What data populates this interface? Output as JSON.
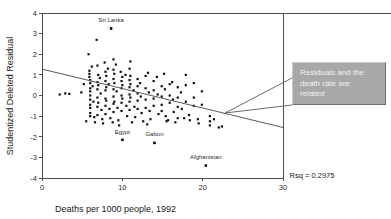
{
  "chart_data": {
    "type": "scatter",
    "title": "",
    "xlabel": "Deaths per 1000 people, 1992",
    "ylabel": "Studentized Deleted Residual",
    "xlim": [
      0,
      30
    ],
    "ylim": [
      -4,
      4
    ],
    "xticks": [
      0,
      10,
      20,
      30
    ],
    "xtick_labels": [
      "0",
      "10",
      "20",
      "30"
    ],
    "yticks": [
      4,
      3,
      2,
      1,
      0,
      -1,
      -2,
      -3,
      -4
    ],
    "ytick_labels": [
      "4",
      "3",
      "2",
      "1",
      "0",
      "-1",
      "-2",
      "-3",
      "-4"
    ],
    "grid": false,
    "legend": null,
    "annotations": [
      {
        "text": "Sri Lanka",
        "x": 8.6,
        "y": 3.55,
        "point_x": 8.6,
        "point_y": 3.25
      },
      {
        "text": "Egypt",
        "x": 10.0,
        "y": -1.85,
        "point_x": 10.0,
        "point_y": -2.15
      },
      {
        "text": "Gabon",
        "x": 14.0,
        "y": -1.95,
        "point_x": 14.0,
        "point_y": -2.3
      },
      {
        "text": "Afghanistan",
        "x": 20.4,
        "y": -3.1,
        "point_x": 20.4,
        "point_y": -3.4
      }
    ],
    "fit_line": {
      "x0": 0.0,
      "y0": 1.28,
      "x1": 30.0,
      "y1": -1.55
    },
    "rsq_label": "Rsq = 0.2975",
    "rsq_value": 0.2975,
    "points": [
      [
        2.2,
        0.05
      ],
      [
        3.4,
        0.08
      ],
      [
        5.8,
        2.0
      ],
      [
        5.9,
        1.2
      ],
      [
        5.9,
        1.05
      ],
      [
        5.9,
        0.9
      ],
      [
        6.0,
        0.75
      ],
      [
        6.0,
        0.6
      ],
      [
        6.0,
        0.35
      ],
      [
        6.0,
        0.2
      ],
      [
        6.0,
        0.0
      ],
      [
        6.0,
        -0.2
      ],
      [
        6.0,
        -0.45
      ],
      [
        6.0,
        -0.6
      ],
      [
        6.0,
        -0.85
      ],
      [
        6.0,
        -1.0
      ],
      [
        6.2,
        1.4
      ],
      [
        6.3,
        0.45
      ],
      [
        6.4,
        -0.3
      ],
      [
        6.5,
        -1.05
      ],
      [
        6.8,
        2.7
      ],
      [
        6.9,
        1.45
      ],
      [
        6.9,
        0.65
      ],
      [
        6.9,
        0.3
      ],
      [
        6.9,
        -0.1
      ],
      [
        6.9,
        -0.55
      ],
      [
        6.9,
        -0.95
      ],
      [
        7.0,
        1.0
      ],
      [
        7.0,
        0.5
      ],
      [
        7.0,
        -0.35
      ],
      [
        7.2,
        0.85
      ],
      [
        7.3,
        0.1
      ],
      [
        7.4,
        -0.7
      ],
      [
        7.5,
        -1.15
      ],
      [
        7.8,
        1.6
      ],
      [
        7.9,
        1.15
      ],
      [
        7.9,
        0.7
      ],
      [
        7.9,
        0.25
      ],
      [
        7.9,
        -0.15
      ],
      [
        7.9,
        -0.5
      ],
      [
        7.9,
        -0.9
      ],
      [
        8.0,
        0.95
      ],
      [
        8.0,
        0.4
      ],
      [
        8.0,
        -0.25
      ],
      [
        8.2,
        1.3
      ],
      [
        8.3,
        0.55
      ],
      [
        8.4,
        -0.65
      ],
      [
        8.5,
        -1.1
      ],
      [
        8.6,
        3.25
      ],
      [
        8.9,
        1.75
      ],
      [
        8.9,
        1.25
      ],
      [
        8.9,
        0.8
      ],
      [
        8.9,
        0.3
      ],
      [
        8.9,
        -0.05
      ],
      [
        8.9,
        -0.4
      ],
      [
        8.9,
        -0.8
      ],
      [
        9.0,
        1.05
      ],
      [
        9.0,
        0.6
      ],
      [
        9.0,
        -0.3
      ],
      [
        9.2,
        1.5
      ],
      [
        9.3,
        0.2
      ],
      [
        9.4,
        -0.6
      ],
      [
        9.5,
        -1.2
      ],
      [
        9.8,
        1.15
      ],
      [
        9.9,
        0.7
      ],
      [
        9.9,
        0.35
      ],
      [
        9.9,
        0.0
      ],
      [
        9.9,
        -0.35
      ],
      [
        9.9,
        -0.75
      ],
      [
        10.0,
        0.9
      ],
      [
        10.0,
        0.5
      ],
      [
        10.0,
        -0.15
      ],
      [
        10.0,
        -2.15
      ],
      [
        10.4,
        1.0
      ],
      [
        10.5,
        -0.5
      ],
      [
        10.6,
        -1.0
      ],
      [
        10.9,
        1.3
      ],
      [
        10.9,
        0.75
      ],
      [
        10.9,
        0.4
      ],
      [
        10.9,
        0.05
      ],
      [
        10.9,
        -0.3
      ],
      [
        10.9,
        -0.7
      ],
      [
        11.0,
        0.95
      ],
      [
        11.0,
        0.55
      ],
      [
        11.0,
        -0.1
      ],
      [
        11.0,
        1.65
      ],
      [
        11.4,
        0.25
      ],
      [
        11.5,
        -0.55
      ],
      [
        11.6,
        -1.05
      ],
      [
        11.9,
        0.8
      ],
      [
        11.9,
        0.45
      ],
      [
        11.9,
        0.1
      ],
      [
        11.9,
        -0.25
      ],
      [
        11.9,
        -0.65
      ],
      [
        12.2,
        0.6
      ],
      [
        12.3,
        -0.05
      ],
      [
        12.4,
        -0.85
      ],
      [
        12.9,
        0.95
      ],
      [
        12.9,
        0.35
      ],
      [
        12.9,
        -0.2
      ],
      [
        12.9,
        -0.6
      ],
      [
        13.2,
        1.1
      ],
      [
        13.3,
        0.15
      ],
      [
        13.4,
        -0.75
      ],
      [
        13.5,
        -1.15
      ],
      [
        13.9,
        0.7
      ],
      [
        13.9,
        0.25
      ],
      [
        13.9,
        -0.15
      ],
      [
        13.9,
        -0.5
      ],
      [
        14.0,
        -2.3
      ],
      [
        14.3,
        0.9
      ],
      [
        14.4,
        0.05
      ],
      [
        14.5,
        -0.9
      ],
      [
        14.9,
        0.45
      ],
      [
        14.9,
        -0.05
      ],
      [
        14.9,
        -0.45
      ],
      [
        14.9,
        -0.75
      ],
      [
        15.2,
        1.05
      ],
      [
        15.3,
        0.3
      ],
      [
        15.4,
        -1.0
      ],
      [
        15.5,
        -1.25
      ],
      [
        15.9,
        0.55
      ],
      [
        15.9,
        0.0
      ],
      [
        15.9,
        -0.35
      ],
      [
        16.2,
        0.65
      ],
      [
        16.3,
        -0.2
      ],
      [
        16.4,
        -0.8
      ],
      [
        16.9,
        0.4
      ],
      [
        16.9,
        -0.1
      ],
      [
        16.9,
        -0.55
      ],
      [
        16.9,
        -1.1
      ],
      [
        17.3,
        0.15
      ],
      [
        17.4,
        -0.65
      ],
      [
        17.9,
        1.0
      ],
      [
        17.9,
        0.5
      ],
      [
        17.9,
        -0.3
      ],
      [
        18.3,
        -0.95
      ],
      [
        18.4,
        -1.2
      ],
      [
        18.9,
        0.6
      ],
      [
        18.9,
        -0.1
      ],
      [
        18.9,
        -0.5
      ],
      [
        19.4,
        -1.15
      ],
      [
        19.5,
        -1.35
      ],
      [
        19.9,
        0.2
      ],
      [
        19.9,
        -0.45
      ],
      [
        20.4,
        -3.4
      ],
      [
        20.9,
        -1.0
      ],
      [
        20.9,
        -1.25
      ],
      [
        20.9,
        -1.45
      ],
      [
        21.4,
        -1.15
      ],
      [
        22.0,
        -1.55
      ],
      [
        22.4,
        -1.5
      ],
      [
        2.9,
        0.1
      ],
      [
        5.5,
        -1.25
      ],
      [
        6.6,
        -1.3
      ],
      [
        7.6,
        -1.35
      ],
      [
        8.8,
        -1.3
      ],
      [
        9.6,
        -1.45
      ],
      [
        11.2,
        -1.3
      ],
      [
        12.6,
        -1.25
      ],
      [
        13.1,
        -1.4
      ],
      [
        15.7,
        -1.2
      ],
      [
        16.6,
        -1.3
      ],
      [
        17.7,
        -1.1
      ],
      [
        4.9,
        0.15
      ],
      [
        5.2,
        0.55
      ]
    ]
  },
  "callout": {
    "text": "Residuals and the\ndeath rate are\nrelated",
    "background_color": "#a8a8a8",
    "text_color": "#f2f2f2",
    "leader_from_x": 292,
    "leader_from_y": 78,
    "leader_to_x": 225,
    "leader_to_y": 113
  }
}
